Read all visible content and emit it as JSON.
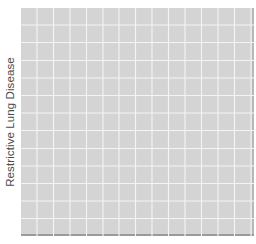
{
  "chart_data": {
    "type": "scatter",
    "title": "",
    "xlabel": "",
    "ylabel": "Restrictive Lung Disease",
    "x": [],
    "y": [],
    "series": [],
    "grid": true,
    "legend": "none",
    "panel": {
      "background": "#d4d4d4",
      "gridline_color": "#f4f4f4",
      "vertical_gridlines": 14,
      "horizontal_gridlines": 12
    }
  }
}
